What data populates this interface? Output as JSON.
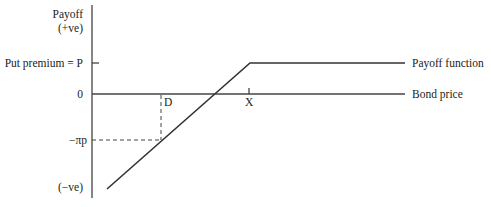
{
  "diagram": {
    "type": "put-option-payoff",
    "y_axis": {
      "top_label_line1": "Payoff",
      "top_label_line2": "(+ve)",
      "bottom_label": "(−ve)",
      "ticks": [
        {
          "label": "Put premium = P",
          "meaning": "premium"
        },
        {
          "label": "0",
          "meaning": "zero"
        },
        {
          "label": "−πp",
          "meaning": "loss at D"
        }
      ]
    },
    "x_axis": {
      "label": "Bond price",
      "ticks": [
        {
          "label": "D",
          "meaning": "price D"
        },
        {
          "label": "X",
          "meaning": "strike price"
        }
      ]
    },
    "series": [
      {
        "name": "Payoff function",
        "shape": "rising line to X, then flat at P"
      }
    ],
    "colors": {
      "line": "#333333",
      "axis": "#444444",
      "background": "#ffffff"
    }
  }
}
